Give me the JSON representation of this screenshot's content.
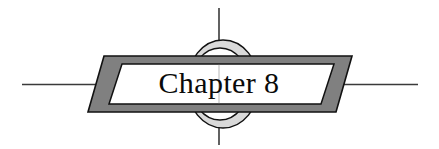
{
  "heading": {
    "title": "Chapter 8",
    "chapter_word": "Chapter",
    "chapter_number": "8"
  },
  "ornament": {
    "crosshair_vertical_name": "vertical rule",
    "crosshair_horizontal_name": "horizontal rule",
    "ring_name": "circle ring",
    "banner_name": "parallelogram banner"
  },
  "colors": {
    "background": "#ffffff",
    "rule": "#3a3a3a",
    "banner_fill": "#808080",
    "banner_stroke": "#111111",
    "inner_panel_fill": "#ffffff",
    "inner_panel_stroke": "#111111",
    "ring_stroke": "#111111",
    "ring_shade": "#d9d9d9",
    "text": "#0a0a0a"
  },
  "geometry": {
    "width": 439,
    "height": 149,
    "vline_x": 219,
    "vline_top": 8,
    "vline_bottom": 145,
    "hline_y": 84,
    "hline_left": 22,
    "hline_right": 418,
    "ring_cx": 223,
    "ring_cy": 84,
    "ring_rx": 36,
    "ring_ry": 44,
    "ring_inner_rx": 29,
    "ring_inner_ry": 36,
    "banner_top": 56,
    "banner_bottom": 112,
    "banner_skew": 16
  }
}
